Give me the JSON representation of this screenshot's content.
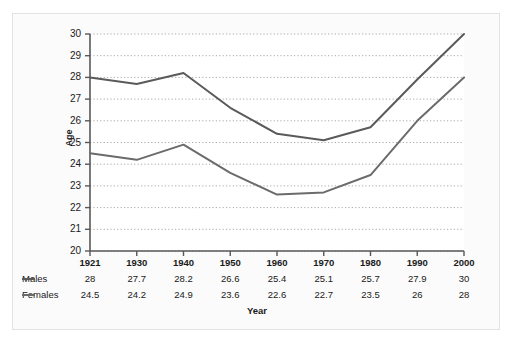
{
  "chart_data": {
    "type": "line",
    "title": "",
    "xlabel": "Year",
    "ylabel": "Age",
    "categories": [
      "1921",
      "1930",
      "1940",
      "1950",
      "1960",
      "1970",
      "1980",
      "1990",
      "2000"
    ],
    "series": [
      {
        "name": "Males",
        "values": [
          28,
          27.7,
          28.2,
          26.6,
          25.4,
          25.1,
          25.7,
          27.9,
          30
        ],
        "color": "#5a5a5a"
      },
      {
        "name": "Females",
        "values": [
          24.5,
          24.2,
          24.9,
          23.6,
          22.6,
          22.7,
          23.5,
          26,
          28
        ],
        "color": "#6b6b6b"
      }
    ],
    "ylim": [
      20,
      30
    ],
    "yticks": [
      "30",
      "29",
      "28",
      "27",
      "26",
      "25",
      "24",
      "23",
      "22",
      "21",
      "20"
    ],
    "grid": true,
    "legend_position": "table-left",
    "gridline_color": "#a9a9a9",
    "axis_color": "#585858",
    "plot_background": "#ffffff"
  },
  "table": {
    "year_header_label": "",
    "rows": [
      {
        "label": "Males",
        "values": [
          "28",
          "27.7",
          "28.2",
          "26.6",
          "25.4",
          "25.1",
          "25.7",
          "27.9",
          "30"
        ]
      },
      {
        "label": "Females",
        "values": [
          "24.5",
          "24.2",
          "24.9",
          "23.6",
          "22.6",
          "22.7",
          "23.5",
          "26",
          "28"
        ]
      }
    ]
  }
}
